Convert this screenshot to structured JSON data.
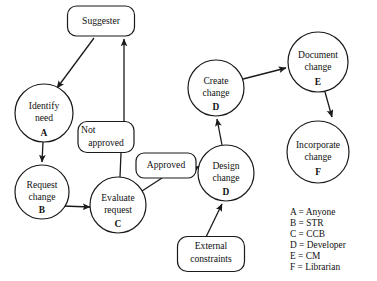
{
  "diagram": {
    "type": "flowchart",
    "nodes": [
      {
        "id": "suggester",
        "shape": "rounded-rect",
        "lines": [
          "Suggester"
        ],
        "role": "",
        "x": 101,
        "y": 21,
        "w": 67,
        "h": 30
      },
      {
        "id": "identify-need",
        "shape": "circle",
        "lines": [
          "Identify",
          "need"
        ],
        "role": "A",
        "x": 44,
        "y": 113,
        "r": 29
      },
      {
        "id": "request-change",
        "shape": "circle",
        "lines": [
          "Request",
          "change"
        ],
        "role": "B",
        "x": 42,
        "y": 192,
        "r": 27
      },
      {
        "id": "not-approved",
        "shape": "rounded-rect",
        "lines": [
          "Not",
          "approved"
        ],
        "role": "",
        "x": 106,
        "y": 137,
        "w": 56,
        "h": 31
      },
      {
        "id": "evaluate-request",
        "shape": "circle",
        "lines": [
          "Evaluate",
          "request"
        ],
        "role": "C",
        "x": 118,
        "y": 205,
        "r": 28
      },
      {
        "id": "approved",
        "shape": "rounded-rect",
        "lines": [
          "Approved"
        ],
        "role": "",
        "x": 166,
        "y": 165,
        "w": 60,
        "h": 25
      },
      {
        "id": "create-change",
        "shape": "circle",
        "lines": [
          "Create",
          "change"
        ],
        "role": "D",
        "x": 216,
        "y": 88,
        "r": 28
      },
      {
        "id": "design-change",
        "shape": "circle",
        "lines": [
          "Design",
          "change"
        ],
        "role": "D",
        "x": 226,
        "y": 173,
        "r": 28
      },
      {
        "id": "document-change",
        "shape": "circle",
        "lines": [
          "Document",
          "change"
        ],
        "role": "E",
        "x": 318,
        "y": 62,
        "r": 30
      },
      {
        "id": "incorporate-change",
        "shape": "circle",
        "lines": [
          "Incorporate",
          "change"
        ],
        "role": "F",
        "x": 318,
        "y": 152,
        "r": 31
      },
      {
        "id": "external-constraints",
        "shape": "rounded-rect",
        "lines": [
          "External",
          "constraints"
        ],
        "role": "",
        "x": 211,
        "y": 254,
        "w": 67,
        "h": 35
      }
    ],
    "edges": [
      {
        "from": "suggester",
        "to": "identify-need",
        "arrow": true
      },
      {
        "from": "identify-need",
        "to": "request-change",
        "arrow": true
      },
      {
        "from": "request-change",
        "to": "evaluate-request",
        "arrow": true
      },
      {
        "from": "not-approved",
        "to": "suggester",
        "arrow": true
      },
      {
        "from": "evaluate-request",
        "to": "not-approved",
        "arrow": false
      },
      {
        "from": "evaluate-request",
        "to": "approved",
        "arrow": false
      },
      {
        "from": "approved",
        "to": "design-change",
        "arrow": true
      },
      {
        "from": "design-change",
        "to": "create-change",
        "arrow": true
      },
      {
        "from": "external-constraints",
        "to": "design-change",
        "arrow": true
      },
      {
        "from": "create-change",
        "to": "document-change",
        "arrow": true
      },
      {
        "from": "document-change",
        "to": "incorporate-change",
        "arrow": true
      }
    ]
  },
  "legend": {
    "entries": [
      {
        "key": "A",
        "eq": "=",
        "value": "Anyone"
      },
      {
        "key": "B",
        "eq": "=",
        "value": "STR"
      },
      {
        "key": "C",
        "eq": "=",
        "value": "CCB"
      },
      {
        "key": "D",
        "eq": "=",
        "value": "Developer"
      },
      {
        "key": "E",
        "eq": "=",
        "value": "CM"
      },
      {
        "key": "F",
        "eq": "=",
        "value": "Librarian"
      }
    ],
    "lines": [
      "A = Anyone",
      "B = STR",
      "C = CCB",
      "D = Developer",
      "E = CM",
      "F = Librarian"
    ]
  },
  "colors": {
    "ink": "#1a1a1a",
    "paper": "#ffffff"
  }
}
